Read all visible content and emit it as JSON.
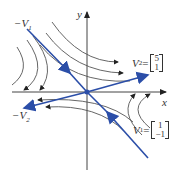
{
  "diagram": {
    "type": "phase-portrait-saddle",
    "axes": {
      "x_label": "x",
      "y_label": "y"
    },
    "colors": {
      "eigenline": "#2b4ea8",
      "trajectory": "#555555",
      "axis": "#444444"
    },
    "labels": {
      "neg_v1": "−V",
      "neg_v1_sub": "1",
      "neg_v2": "−V",
      "neg_v2_sub": "2",
      "v2_name": "V",
      "v2_sub": "2",
      "v2_eq": " =",
      "v2_top": "5",
      "v2_bottom": "1",
      "v1_name": "V",
      "v1_sub": "1",
      "v1_eq": " =",
      "v1_top": "1",
      "v1_bottom": "−1"
    }
  }
}
